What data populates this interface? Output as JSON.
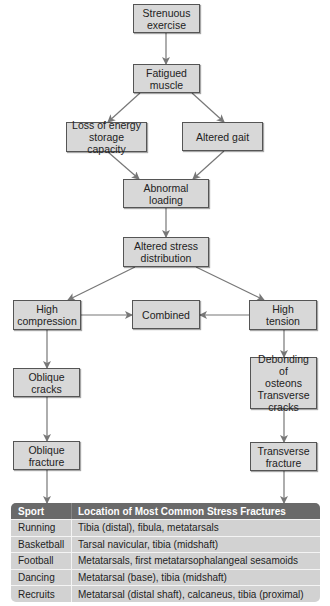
{
  "flowchart": {
    "nodes": [
      {
        "id": "strenuous",
        "label": "Strenuous\nexercise",
        "x": 133,
        "y": 4,
        "w": 67,
        "h": 29
      },
      {
        "id": "fatigued",
        "label": "Fatigued\nmuscle",
        "x": 133,
        "y": 64,
        "w": 67,
        "h": 29
      },
      {
        "id": "loss",
        "label": "Loss of energy\nstorage capacity",
        "x": 66,
        "y": 122,
        "w": 81,
        "h": 30
      },
      {
        "id": "gait",
        "label": "Altered gait",
        "x": 182,
        "y": 122,
        "w": 81,
        "h": 29
      },
      {
        "id": "abnormal",
        "label": "Abnormal loading",
        "x": 123,
        "y": 179,
        "w": 86,
        "h": 29
      },
      {
        "id": "altered_stress",
        "label": "Altered stress\ndistribution",
        "x": 123,
        "y": 237,
        "w": 86,
        "h": 30
      },
      {
        "id": "high_compression",
        "label": "High\ncompression",
        "x": 13,
        "y": 300,
        "w": 68,
        "h": 30
      },
      {
        "id": "combined",
        "label": "Combined",
        "x": 132,
        "y": 300,
        "w": 68,
        "h": 29
      },
      {
        "id": "high_tension",
        "label": "High\ntension",
        "x": 249,
        "y": 300,
        "w": 68,
        "h": 30
      },
      {
        "id": "oblique_cracks",
        "label": "Oblique\ncracks",
        "x": 13,
        "y": 368,
        "w": 67,
        "h": 29
      },
      {
        "id": "debonding",
        "label": "Debonding of\nosteons\nTransverse\ncracks",
        "x": 250,
        "y": 357,
        "w": 67,
        "h": 52
      },
      {
        "id": "oblique_fracture",
        "label": "Oblique\nfracture",
        "x": 13,
        "y": 441,
        "w": 67,
        "h": 29
      },
      {
        "id": "transverse_fracture",
        "label": "Transverse\nfracture",
        "x": 250,
        "y": 442,
        "w": 67,
        "h": 29
      }
    ],
    "edges": [
      {
        "from": "strenuous",
        "to": "fatigued",
        "points": [
          [
            166,
            33
          ],
          [
            166,
            64
          ]
        ]
      },
      {
        "from": "fatigued",
        "to": "loss",
        "points": [
          [
            140,
            93
          ],
          [
            108,
            122
          ]
        ]
      },
      {
        "from": "fatigued",
        "to": "gait",
        "points": [
          [
            192,
            93
          ],
          [
            224,
            122
          ]
        ]
      },
      {
        "from": "loss",
        "to": "abnormal",
        "points": [
          [
            108,
            152
          ],
          [
            139,
            179
          ]
        ]
      },
      {
        "from": "gait",
        "to": "abnormal",
        "points": [
          [
            224,
            151
          ],
          [
            193,
            179
          ]
        ]
      },
      {
        "from": "abnormal",
        "to": "altered_stress",
        "points": [
          [
            166,
            208
          ],
          [
            166,
            237
          ]
        ]
      },
      {
        "from": "altered_stress",
        "to": "high_compression",
        "points": [
          [
            135,
            267
          ],
          [
            68,
            300
          ]
        ]
      },
      {
        "from": "altered_stress",
        "to": "high_tension",
        "points": [
          [
            196,
            267
          ],
          [
            264,
            300
          ]
        ]
      },
      {
        "from": "high_compression",
        "to": "combined",
        "points": [
          [
            81,
            315
          ],
          [
            132,
            315
          ]
        ]
      },
      {
        "from": "high_tension",
        "to": "combined",
        "points": [
          [
            249,
            315
          ],
          [
            200,
            315
          ]
        ]
      },
      {
        "from": "high_compression",
        "to": "oblique_cracks",
        "points": [
          [
            47,
            330
          ],
          [
            47,
            368
          ]
        ]
      },
      {
        "from": "high_tension",
        "to": "debonding",
        "points": [
          [
            284,
            330
          ],
          [
            284,
            357
          ]
        ]
      },
      {
        "from": "oblique_cracks",
        "to": "oblique_fracture",
        "points": [
          [
            47,
            397
          ],
          [
            47,
            441
          ]
        ]
      },
      {
        "from": "debonding",
        "to": "transverse_fracture",
        "points": [
          [
            284,
            409
          ],
          [
            284,
            442
          ]
        ]
      },
      {
        "from": "oblique_fracture",
        "to": "table",
        "points": [
          [
            47,
            470
          ],
          [
            47,
            503
          ]
        ]
      },
      {
        "from": "transverse_fracture",
        "to": "table",
        "points": [
          [
            284,
            471
          ],
          [
            284,
            503
          ]
        ]
      }
    ],
    "colors": {
      "box_fill": "#d8d8d8",
      "box_border": "#555555",
      "arrow": "#777777",
      "table_header": "#6a6a6a",
      "table_row": "#d2d2d2"
    }
  },
  "table": {
    "headers": [
      "Sport",
      "Location of Most Common Stress Fractures"
    ],
    "rows": [
      [
        "Running",
        "Tibia (distal), fibula, metatarsals"
      ],
      [
        "Basketball",
        "Tarsal navicular, tibia (midshaft)"
      ],
      [
        "Football",
        "Metatarsals, first metatarsophalangeal sesamoids"
      ],
      [
        "Dancing",
        "Metatarsal (base), tibia (midshaft)"
      ],
      [
        "Recruits",
        "Metatarsal (distal shaft), calcaneus, tibia (proximal)"
      ]
    ]
  }
}
